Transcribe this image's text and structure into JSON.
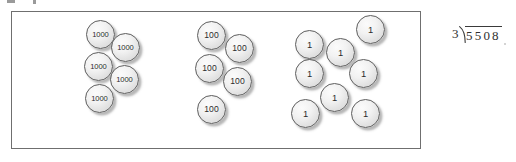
{
  "worksheet": {
    "title": "Place value counters with long division",
    "box": {
      "label": "counter-box"
    }
  },
  "groups": [
    {
      "name": "thousands",
      "value_label": "1000",
      "count": 5,
      "discs": [
        {
          "label": "1000",
          "x": 85,
          "y": 19
        },
        {
          "label": "1000",
          "x": 110,
          "y": 32
        },
        {
          "label": "1000",
          "x": 83,
          "y": 51
        },
        {
          "label": "1000",
          "x": 109,
          "y": 64
        },
        {
          "label": "1000",
          "x": 84,
          "y": 83
        }
      ]
    },
    {
      "name": "hundreds",
      "value_label": "100",
      "count": 5,
      "discs": [
        {
          "label": "100",
          "x": 196,
          "y": 20
        },
        {
          "label": "100",
          "x": 224,
          "y": 33
        },
        {
          "label": "100",
          "x": 194,
          "y": 53
        },
        {
          "label": "100",
          "x": 222,
          "y": 66
        },
        {
          "label": "100",
          "x": 196,
          "y": 94
        }
      ]
    },
    {
      "name": "ones",
      "value_label": "1",
      "count": 8,
      "discs": [
        {
          "label": "1",
          "x": 355,
          "y": 14
        },
        {
          "label": "1",
          "x": 294,
          "y": 29
        },
        {
          "label": "1",
          "x": 325,
          "y": 37
        },
        {
          "label": "1",
          "x": 294,
          "y": 58
        },
        {
          "label": "1",
          "x": 348,
          "y": 58
        },
        {
          "label": "1",
          "x": 319,
          "y": 82
        },
        {
          "label": "1",
          "x": 290,
          "y": 98
        },
        {
          "label": "1",
          "x": 350,
          "y": 98
        }
      ]
    }
  ],
  "long_division": {
    "divisor": "3",
    "dividend": "5508",
    "expression": "3)5508"
  }
}
